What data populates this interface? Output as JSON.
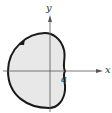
{
  "figure": {
    "type": "polar-curve",
    "axes": {
      "x_label": "x",
      "y_label": "y"
    },
    "point_label": "a",
    "colors": {
      "fill": "#e8e8e8",
      "curve": "#1a1a1a",
      "axes": "#555555"
    }
  }
}
